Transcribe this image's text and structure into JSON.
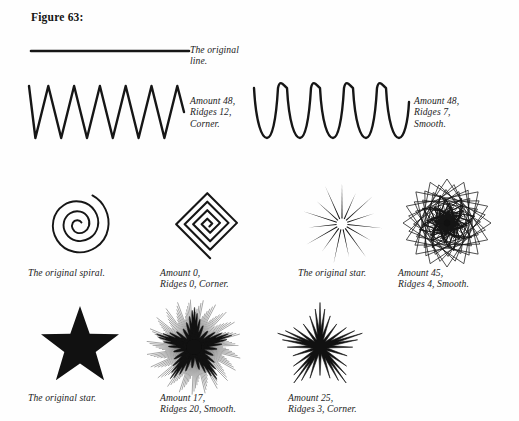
{
  "figure": {
    "caption": "Figure 63:",
    "colors": {
      "ink": "#161616",
      "fill": "#111111",
      "page": "#ffffff"
    }
  },
  "rows": [
    {
      "id": "row-line",
      "items": [
        {
          "name": "original-line",
          "shape": "straight-line",
          "label": "The original\nline.",
          "params": {
            "amount": null,
            "ridges": null,
            "style": null
          }
        }
      ]
    },
    {
      "id": "row-waves",
      "items": [
        {
          "name": "wave-corner",
          "shape": "zigzag-wave",
          "label": "Amount 48,\nRidges 12,\nCorner.",
          "params": {
            "amount": 48,
            "ridges": 12,
            "style": "Corner"
          }
        },
        {
          "name": "wave-smooth",
          "shape": "sine-wave",
          "label": "Amount 48,\nRidges 7,\nSmooth.",
          "params": {
            "amount": 48,
            "ridges": 7,
            "style": "Smooth"
          }
        }
      ]
    },
    {
      "id": "row-spirals-stars",
      "items": [
        {
          "name": "spiral-original",
          "shape": "archimedean-spiral",
          "label": "The original spiral.",
          "params": {
            "amount": null,
            "ridges": null,
            "style": null
          }
        },
        {
          "name": "spiral-corner",
          "shape": "square-spiral",
          "label": "Amount 0,\nRidges 0, Corner.",
          "params": {
            "amount": 0,
            "ridges": 0,
            "style": "Corner"
          }
        },
        {
          "name": "star-outline",
          "shape": "starburst-spikes",
          "label": "The original star.",
          "params": {
            "amount": null,
            "ridges": null,
            "style": null
          }
        },
        {
          "name": "star-rosette",
          "shape": "rosette-spirograph",
          "label": "Amount 45,\nRidges 4, Smooth.",
          "params": {
            "amount": 45,
            "ridges": 4,
            "style": "Smooth"
          }
        }
      ]
    },
    {
      "id": "row-solid-stars",
      "items": [
        {
          "name": "star-solid",
          "shape": "filled-five-point-star",
          "label": "The original star.",
          "params": {
            "amount": null,
            "ridges": null,
            "style": null
          }
        },
        {
          "name": "star-ripple",
          "shape": "rippled-star",
          "label": "Amount 17,\nRidges 20, Smooth.",
          "params": {
            "amount": 17,
            "ridges": 20,
            "style": "Smooth"
          }
        },
        {
          "name": "star-jagged",
          "shape": "jagged-star",
          "label": "Amount 25,\nRidges 3, Corner.",
          "params": {
            "amount": 25,
            "ridges": 3,
            "style": "Corner"
          }
        }
      ]
    }
  ]
}
